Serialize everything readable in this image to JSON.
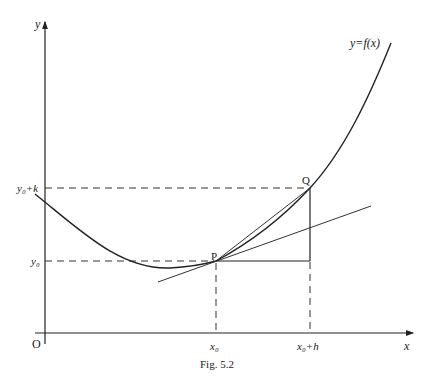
{
  "figure": {
    "caption": "Fig. 5.2",
    "axes": {
      "x_label": "x",
      "y_label": "y",
      "origin_label": "O"
    },
    "curve_label": "y=f(x)",
    "points": {
      "P": "P",
      "Q": "Q"
    },
    "x_ticks": [
      {
        "label": "x₀"
      },
      {
        "label": "x₀+h"
      }
    ],
    "y_ticks": [
      {
        "label": "y₀"
      },
      {
        "label": "y₀+k"
      }
    ],
    "elements": [
      "curve y=f(x)",
      "tangent at P",
      "secant PQ",
      "horizontal segment from P",
      "vertical segment to Q",
      "dashed guides"
    ]
  }
}
